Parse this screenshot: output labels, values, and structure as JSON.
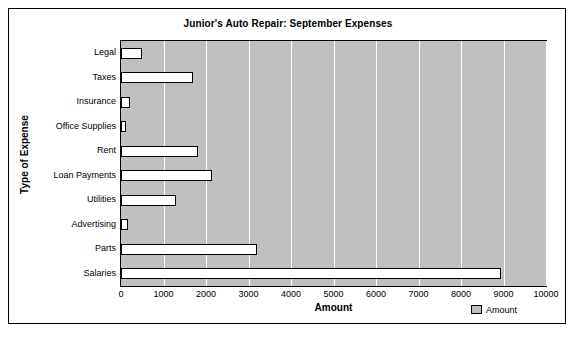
{
  "chart_data": {
    "type": "bar",
    "orientation": "horizontal",
    "title": "Junior's Auto Repair: September Expenses",
    "xlabel": "Amount",
    "ylabel": "Type of Expense",
    "categories": [
      "Legal",
      "Taxes",
      "Insurance",
      "Office Supplies",
      "Rent",
      "Loan Payments",
      "Utilities",
      "Advertising",
      "Parts",
      "Salaries"
    ],
    "values": [
      500,
      1700,
      200,
      125,
      1800,
      2150,
      1300,
      175,
      3200,
      8950
    ],
    "series": [
      {
        "name": "Amount",
        "values": [
          500,
          1700,
          200,
          125,
          1800,
          2150,
          1300,
          175,
          3200,
          8950
        ]
      }
    ],
    "xticks": [
      0,
      1000,
      2000,
      3000,
      4000,
      5000,
      6000,
      7000,
      8000,
      9000,
      10000
    ],
    "xtick_labels": [
      "0",
      "1000",
      "2000",
      "3000",
      "4000",
      "5000",
      "6000",
      "7000",
      "8000",
      "9000",
      "10000"
    ],
    "xlim": [
      0,
      10000
    ],
    "grid": "vertical",
    "legend": [
      "Amount"
    ],
    "legend_position": "bottom-right",
    "colors": {
      "plot_background": "#c0c0c0",
      "bar_fill": "#ffffff",
      "bar_border": "#000000",
      "gridline": "#ffffff",
      "text": "#000000",
      "page_background": "#ffffff"
    }
  }
}
